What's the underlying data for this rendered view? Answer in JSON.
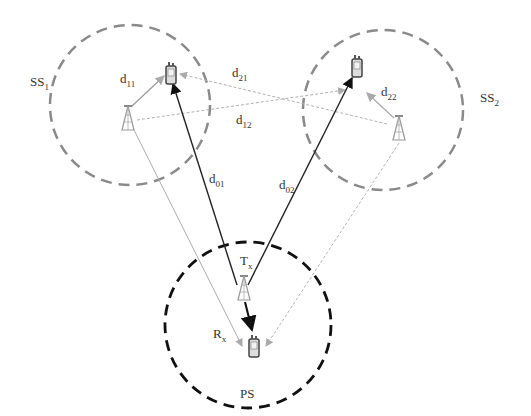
{
  "diagram": {
    "regions": [
      {
        "id": "ss1",
        "label": "SS",
        "sub": "1",
        "color": "#8a8a8a"
      },
      {
        "id": "ss2",
        "label": "SS",
        "sub": "2",
        "color": "#8a8a8a"
      },
      {
        "id": "ps",
        "label": "PS",
        "sub": "",
        "color": "#111111"
      }
    ],
    "links": {
      "d11": {
        "label": "d",
        "sub": "11"
      },
      "d21": {
        "label": "d",
        "sub": "21"
      },
      "d12": {
        "label": "d",
        "sub": "12"
      },
      "d22": {
        "label": "d",
        "sub": "22"
      },
      "d01": {
        "label": "d",
        "sub": "01"
      },
      "d02": {
        "label": "d",
        "sub": "02"
      }
    },
    "ps_tx": {
      "label": "T",
      "sub": "x"
    },
    "ps_rx": {
      "label": "R",
      "sub": "x"
    },
    "colors": {
      "primary_link": "#222222",
      "secondary_link": "#9a9a9a",
      "interference": "#b0b0b0"
    }
  }
}
